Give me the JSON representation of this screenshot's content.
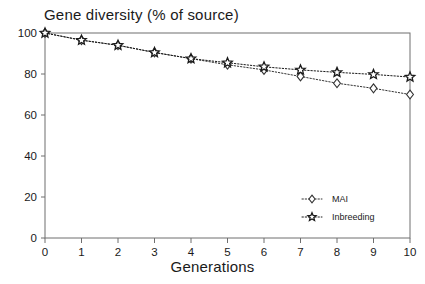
{
  "chart_data": {
    "type": "line",
    "title": "Gene diversity (% of source)",
    "xlabel": "Generations",
    "ylabel": "",
    "x": [
      0,
      1,
      2,
      3,
      4,
      5,
      6,
      7,
      8,
      9,
      10
    ],
    "xticklabels": [
      "0",
      "1",
      "2",
      "3",
      "4",
      "5",
      "6",
      "7",
      "8",
      "9",
      "10"
    ],
    "yticklabels": [
      "0",
      "20",
      "40",
      "60",
      "80",
      "100"
    ],
    "yticks": [
      0,
      20,
      40,
      60,
      80,
      100
    ],
    "xlim": [
      0,
      10
    ],
    "ylim": [
      0,
      100
    ],
    "grid": false,
    "legend_position": "lower right",
    "series": [
      {
        "name": "MAI",
        "marker": "diamond-open",
        "linestyle": "dotted",
        "color": "#333333",
        "values": [
          100,
          96.5,
          94,
          90.5,
          87.5,
          84.5,
          82,
          78.8,
          75.5,
          73,
          70
        ]
      },
      {
        "name": "Inbreeding",
        "marker": "star",
        "linestyle": "dotted",
        "color": "#1a1a1a",
        "values": [
          100,
          96.5,
          94,
          90.5,
          87.5,
          85.5,
          83.5,
          82,
          80.8,
          79.8,
          78.5
        ]
      }
    ]
  },
  "legend": {
    "items": [
      {
        "label": "MAI"
      },
      {
        "label": "Inbreeding"
      }
    ]
  },
  "colors": {
    "axis": "#6f6f6f",
    "text": "#1a1a1a",
    "series_mai": "#333333",
    "series_inbreeding": "#1a1a1a",
    "background": "#ffffff"
  }
}
